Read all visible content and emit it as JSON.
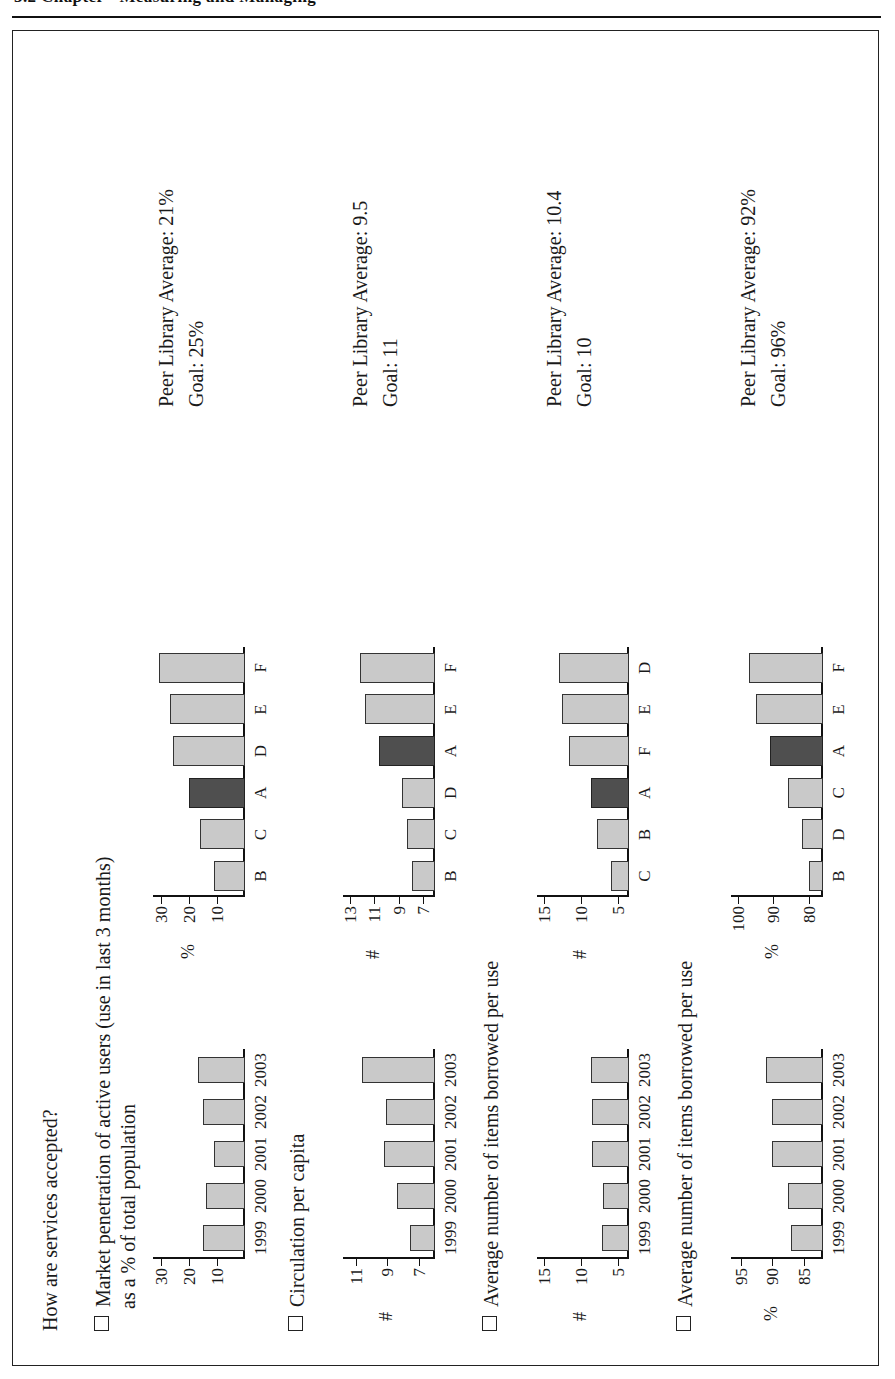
{
  "page": {
    "running_header": "3.2   Chapter  ·  Measuring and Managing",
    "question": "How are services accepted?"
  },
  "legend": {
    "own_library_letter": "A",
    "own_library_color": "#4f4f4f",
    "peer_color": "#c9c9c9"
  },
  "sections": [
    {
      "id": "market-penetration",
      "label_line1": "Market penetration of active users (use in last 3 months)",
      "label_line2": "as a % of total population",
      "note_peer": "Peer Library Average: 21%",
      "note_goal": "Goal: 25%",
      "trend": {
        "type": "bar",
        "title": "Market penetration of active users as a % of total population",
        "unit": "",
        "categories": [
          "1999",
          "2000",
          "2001",
          "2002",
          "2003"
        ],
        "values": [
          15,
          14,
          11,
          15,
          17
        ],
        "yticks": [
          10,
          20,
          30
        ],
        "ytick_labels": [
          "10",
          "20",
          "30"
        ],
        "ylim": [
          0,
          33
        ],
        "ylabel": ""
      },
      "peers": {
        "type": "bar",
        "title": "Market penetration — peer comparison",
        "unit": "%",
        "categories": [
          "B",
          "C",
          "A",
          "D",
          "E",
          "F"
        ],
        "values": [
          11,
          16,
          20,
          26,
          27,
          31
        ],
        "highlight": "A",
        "yticks": [
          10,
          20,
          30
        ],
        "ytick_labels": [
          "10",
          "20",
          "30"
        ],
        "ylim": [
          0,
          33
        ],
        "ylabel": "%"
      }
    },
    {
      "id": "circulation-per-capita",
      "label_line1": "Circulation per capita",
      "label_line2": "",
      "note_peer": "Peer Library Average: 9.5",
      "note_goal": "Goal: 11",
      "trend": {
        "type": "bar",
        "title": "Circulation per capita",
        "unit": "#",
        "categories": [
          "1999",
          "2000",
          "2001",
          "2002",
          "2003"
        ],
        "values": [
          7.6,
          8.4,
          9.2,
          9.1,
          10.6
        ],
        "yticks": [
          7,
          9,
          11
        ],
        "ytick_labels": [
          "7",
          "9",
          "11"
        ],
        "ylim": [
          6,
          11.8
        ],
        "ylabel": "#"
      },
      "peers": {
        "type": "bar",
        "title": "Circulation per capita — peer comparison",
        "unit": "#",
        "categories": [
          "B",
          "C",
          "D",
          "A",
          "E",
          "F"
        ],
        "values": [
          7.9,
          8.3,
          8.7,
          10.6,
          11.8,
          12.2
        ],
        "highlight": "A",
        "yticks": [
          7,
          9,
          11,
          13
        ],
        "ytick_labels": [
          "7",
          "9",
          "11",
          "13"
        ],
        "ylim": [
          6,
          13.6
        ],
        "ylabel": "#"
      }
    },
    {
      "id": "items-borrowed-per-use-1",
      "label_line1": "Average number of items borrowed per use",
      "label_line2": "",
      "note_peer": "Peer Library Average: 10.4",
      "note_goal": "Goal: 10",
      "trend": {
        "type": "bar",
        "title": "Average number of items borrowed per use",
        "unit": "#",
        "categories": [
          "1999",
          "2000",
          "2001",
          "2002",
          "2003"
        ],
        "values": [
          7.2,
          7.0,
          8.5,
          8.5,
          8.6
        ],
        "yticks": [
          5,
          10,
          15
        ],
        "ytick_labels": [
          "5",
          "10",
          "15"
        ],
        "ylim": [
          3.5,
          16
        ],
        "ylabel": "#"
      },
      "peers": {
        "type": "bar",
        "title": "Items borrowed per use — peer comparison",
        "unit": "#",
        "categories": [
          "C",
          "B",
          "A",
          "F",
          "E",
          "D"
        ],
        "values": [
          6.0,
          7.8,
          8.6,
          11.6,
          12.6,
          13.0
        ],
        "highlight": "A",
        "yticks": [
          5,
          10,
          15
        ],
        "ytick_labels": [
          "5",
          "10",
          "15"
        ],
        "ylim": [
          3.5,
          16
        ],
        "ylabel": "#"
      }
    },
    {
      "id": "items-borrowed-per-use-2",
      "label_line1": "Average number of items borrowed per use",
      "label_line2": "",
      "note_peer": "Peer Library Average: 92%",
      "note_goal": "Goal: 96%",
      "trend": {
        "type": "bar",
        "title": "Average number of items borrowed per use",
        "unit": "%",
        "categories": [
          "1999",
          "2000",
          "2001",
          "2002",
          "2003"
        ],
        "values": [
          87,
          87.5,
          90,
          90,
          91
        ],
        "yticks": [
          85,
          90,
          95
        ],
        "ytick_labels": [
          "85",
          "90",
          "95"
        ],
        "ylim": [
          82,
          96.5
        ],
        "ylabel": "%"
      },
      "peers": {
        "type": "bar",
        "title": "Items borrowed per use — peer comparison",
        "unit": "%",
        "categories": [
          "B",
          "D",
          "C",
          "A",
          "E",
          "F"
        ],
        "values": [
          80,
          82,
          86,
          91,
          95,
          97
        ],
        "highlight": "A",
        "yticks": [
          80,
          90,
          100
        ],
        "ytick_labels": [
          "80",
          "90",
          "100"
        ],
        "ylim": [
          76,
          102
        ],
        "ylabel": "%"
      }
    }
  ]
}
